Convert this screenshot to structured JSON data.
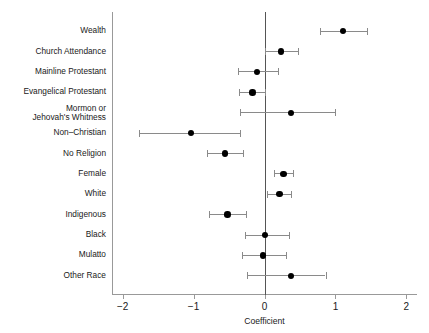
{
  "chart_data": {
    "type": "scatter",
    "title": "",
    "subtitle": "",
    "xlabel": "Coefficient",
    "ylabel": "",
    "xlim": [
      -2.15,
      2.15
    ],
    "xticks": [
      -2,
      -1,
      0,
      1,
      2
    ],
    "xticklabels": [
      "−2",
      "−1",
      "0",
      "1",
      "2"
    ],
    "grid": false,
    "legend": null,
    "reference_line": 0,
    "categories": [
      "Wealth",
      "Church Attendance",
      "Mainline Protestant",
      "Evangelical Protestant",
      "Mormon or\nJehovah's Whitness",
      "Non–Christian",
      "No Religion",
      "Female",
      "White",
      "Indigenous",
      "Black",
      "Mulatto",
      "Other Race"
    ],
    "points": [
      {
        "label": "Wealth",
        "estimate": 1.11,
        "ci_low": 0.78,
        "ci_high": 1.45
      },
      {
        "label": "Church Attendance",
        "estimate": 0.23,
        "ci_low": 0.01,
        "ci_high": 0.47
      },
      {
        "label": "Mainline Protestant",
        "estimate": -0.11,
        "ci_low": -0.37,
        "ci_high": 0.19
      },
      {
        "label": "Evangelical Protestant",
        "estimate": -0.17,
        "ci_low": -0.36,
        "ci_high": 0.01
      },
      {
        "label": "Mormon or Jehovah's Whitness",
        "estimate": 0.37,
        "ci_low": -0.34,
        "ci_high": 1.0
      },
      {
        "label": "Non–Christian",
        "estimate": -1.04,
        "ci_low": -1.77,
        "ci_high": -0.34
      },
      {
        "label": "No Religion",
        "estimate": -0.56,
        "ci_low": -0.81,
        "ci_high": -0.3
      },
      {
        "label": "Female",
        "estimate": 0.27,
        "ci_low": 0.14,
        "ci_high": 0.4
      },
      {
        "label": "White",
        "estimate": 0.21,
        "ci_low": 0.03,
        "ci_high": 0.37
      },
      {
        "label": "Indigenous",
        "estimate": -0.52,
        "ci_low": -0.78,
        "ci_high": -0.26
      },
      {
        "label": "Black",
        "estimate": 0.01,
        "ci_low": -0.28,
        "ci_high": 0.35
      },
      {
        "label": "Mulatto",
        "estimate": -0.02,
        "ci_low": -0.32,
        "ci_high": 0.3
      },
      {
        "label": "Other Race",
        "estimate": 0.37,
        "ci_low": -0.25,
        "ci_high": 0.86
      }
    ]
  },
  "colors": {
    "point": "#000000",
    "whisker": "#8a8a8a",
    "axis": "#999999",
    "zero_line": "#555555",
    "text": "#1a1a1a",
    "background": "#ffffff"
  }
}
